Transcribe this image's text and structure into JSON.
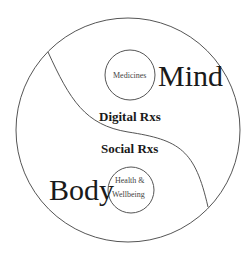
{
  "diagram": {
    "regions": {
      "mind": "Mind",
      "body": "Body"
    },
    "bubbles": {
      "medicines": "Medicines",
      "health_line1": "Health &",
      "health_line2": "Wellbeing"
    },
    "middle_labels": {
      "digital": "Digital Rxs",
      "social": "Social Rxs"
    },
    "colors": {
      "stroke": "#555555",
      "text": "#1a1a1a",
      "background": "#ffffff"
    }
  }
}
